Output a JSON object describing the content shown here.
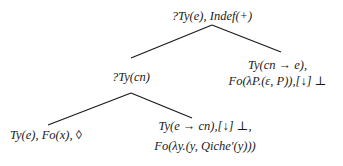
{
  "diagram": {
    "type": "tree",
    "nodes": {
      "root": {
        "label": "?Ty(e), Indef(+)"
      },
      "cn": {
        "label": "?Ty(cn)"
      },
      "right": {
        "line1": "Ty(cn → e),",
        "line2": "Fo(λP.(ε, P)),[↓] ⊥"
      },
      "left_leaf": {
        "label": "Ty(e), Fo(x), ◊"
      },
      "bottom_right": {
        "line1": "Ty(e → cn),[↓] ⊥,",
        "line2": "Fo(λy.(y, Qiche′(y)))"
      }
    },
    "edges": [
      {
        "from": "root",
        "to": "cn"
      },
      {
        "from": "root",
        "to": "right"
      },
      {
        "from": "cn",
        "to": "left_leaf"
      },
      {
        "from": "cn",
        "to": "bottom_right"
      }
    ],
    "colors": {
      "line": "#1a1a1a",
      "text": "#1a1a1a",
      "background": "#ffffff"
    }
  }
}
